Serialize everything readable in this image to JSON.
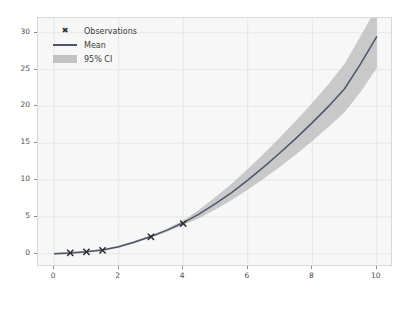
{
  "chart_data": {
    "type": "line",
    "title": "",
    "xlabel": "",
    "ylabel": "",
    "xlim": [
      -0.5,
      10.5
    ],
    "ylim": [
      -1.8,
      32.0
    ],
    "xticks": [
      0,
      2,
      4,
      6,
      8,
      10
    ],
    "yticks": [
      0,
      5,
      10,
      15,
      20,
      25,
      30
    ],
    "grid": true,
    "legend_position": "upper left",
    "legend": [
      {
        "label": "Observations",
        "style": "marker",
        "marker": "x",
        "color": "#2f2f2f"
      },
      {
        "label": "Mean",
        "style": "line",
        "color": "#4c566a"
      },
      {
        "label": "95% CI",
        "style": "band",
        "color": "#b9b9b9"
      }
    ],
    "series": [
      {
        "name": "Observations",
        "type": "scatter",
        "marker": "x",
        "x": [
          0.5,
          1.0,
          1.5,
          3.0,
          4.0
        ],
        "y": [
          0.12,
          0.25,
          0.45,
          2.3,
          4.1
        ]
      },
      {
        "name": "Mean",
        "type": "line",
        "x": [
          0,
          0.5,
          1,
          1.5,
          2,
          2.5,
          3,
          3.5,
          4,
          4.5,
          5,
          5.5,
          6,
          6.5,
          7,
          7.5,
          8,
          8.5,
          9,
          9.5,
          10
        ],
        "y": [
          0.0,
          0.1,
          0.28,
          0.5,
          0.95,
          1.6,
          2.35,
          3.2,
          4.2,
          5.4,
          6.8,
          8.3,
          10.0,
          11.8,
          13.7,
          15.7,
          17.8,
          20.0,
          22.4,
          25.8,
          29.5
        ]
      },
      {
        "name": "95% CI",
        "type": "band",
        "x": [
          0,
          0.5,
          1,
          1.5,
          2,
          2.5,
          3,
          3.5,
          4,
          4.5,
          5,
          5.5,
          6,
          6.5,
          7,
          7.5,
          8,
          8.5,
          9,
          9.5,
          10
        ],
        "lower": [
          -0.15,
          -0.05,
          0.15,
          0.38,
          0.8,
          1.45,
          2.2,
          3.0,
          3.9,
          4.85,
          6.0,
          7.3,
          8.7,
          10.2,
          11.8,
          13.5,
          15.3,
          17.2,
          19.2,
          22.0,
          25.2
        ],
        "upper": [
          0.15,
          0.25,
          0.42,
          0.64,
          1.1,
          1.75,
          2.5,
          3.4,
          4.55,
          6.0,
          7.7,
          9.5,
          11.5,
          13.6,
          15.8,
          18.1,
          20.5,
          23.0,
          25.8,
          29.6,
          33.5
        ]
      }
    ]
  }
}
